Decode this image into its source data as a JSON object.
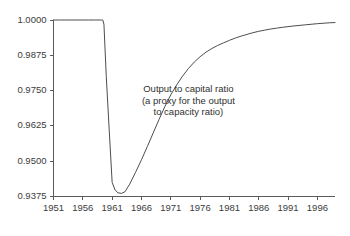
{
  "chart_data": {
    "type": "line",
    "title": "",
    "subtitle": "",
    "xlabel": "",
    "ylabel": "",
    "xlim": [
      1951,
      1999
    ],
    "ylim": [
      0.9375,
      1.0
    ],
    "grid": false,
    "legend": null,
    "y_ticks": [
      0.9375,
      0.95,
      0.9625,
      0.975,
      0.9875,
      1.0
    ],
    "y_tick_labels": [
      "0.9375",
      "0.9500",
      "0.9625",
      "0.9750",
      "0.9875",
      "1.0000"
    ],
    "x_ticks": [
      1951,
      1956,
      1961,
      1966,
      1971,
      1976,
      1981,
      1986,
      1991,
      1996
    ],
    "x_tick_labels": [
      "1951",
      "1956",
      "1961",
      "1966",
      "1971",
      "1976",
      "1981",
      "1986",
      "1991",
      "1996"
    ],
    "annotations": [
      {
        "name": "series-annotation",
        "lines": [
          "Output to capital ratio",
          "(a proxy for the output",
          "to capacity ratio)"
        ],
        "x": 1974.0,
        "y": 0.9745
      }
    ],
    "series": [
      {
        "name": "Output to capital ratio",
        "color": "#4d4d4d",
        "x": [
          1951.0,
          1952.0,
          1953.0,
          1954.0,
          1955.0,
          1956.0,
          1957.0,
          1958.0,
          1959.0,
          1959.4,
          1959.6,
          1960.0,
          1960.5,
          1961.0,
          1961.5,
          1962.0,
          1962.6,
          1963.2,
          1964.0,
          1965.0,
          1966.0,
          1967.0,
          1968.0,
          1969.0,
          1970.0,
          1971.0,
          1972.0,
          1973.0,
          1974.0,
          1975.0,
          1976.0,
          1977.0,
          1978.0,
          1979.0,
          1980.0,
          1981.0,
          1982.0,
          1983.0,
          1984.0,
          1985.0,
          1986.0,
          1987.0,
          1988.0,
          1989.0,
          1990.0,
          1992.0,
          1994.0,
          1996.0,
          1998.0,
          1999.0
        ],
        "y": [
          1.0,
          1.0,
          1.0,
          1.0,
          1.0,
          1.0,
          1.0,
          1.0,
          1.0,
          1.0,
          0.9985,
          0.98,
          0.961,
          0.9425,
          0.9398,
          0.9388,
          0.9386,
          0.9392,
          0.9419,
          0.9461,
          0.9505,
          0.9552,
          0.96,
          0.9648,
          0.9694,
          0.9735,
          0.977,
          0.9801,
          0.9828,
          0.9851,
          0.987,
          0.9886,
          0.9899,
          0.991,
          0.9919,
          0.9928,
          0.9936,
          0.9943,
          0.9949,
          0.9955,
          0.996,
          0.9964,
          0.9968,
          0.9971,
          0.9974,
          0.9979,
          0.9983,
          0.9987,
          0.999,
          0.9991
        ]
      }
    ]
  },
  "figure": {
    "background_color": "#ffffff",
    "line_color": "#4d4d4d",
    "axis_color": "#5a5a5a",
    "text_color": "#3c3c3c"
  }
}
